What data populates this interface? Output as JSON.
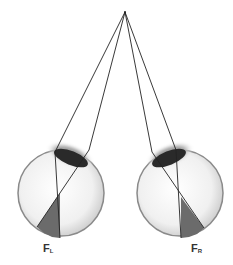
{
  "diagram": {
    "type": "binocular-vision-eyes",
    "fixation_point": {
      "x": 125,
      "y": 12
    },
    "eyes": [
      {
        "id": "left",
        "label_main": "F",
        "label_sub": "L",
        "center": {
          "x": 61,
          "y": 193
        },
        "radius": 43
      },
      {
        "id": "right",
        "label_main": "F",
        "label_sub": "R",
        "center": {
          "x": 180,
          "y": 193
        },
        "radius": 43
      }
    ],
    "colors": {
      "line": "#222222",
      "eyeball_fill": "#f4f4f4",
      "eyeball_edge": "#8a8a8a",
      "lens": "#2a2a2a",
      "lens_halo": "#9a9a9a",
      "wedge": "#6b6b6b"
    }
  }
}
